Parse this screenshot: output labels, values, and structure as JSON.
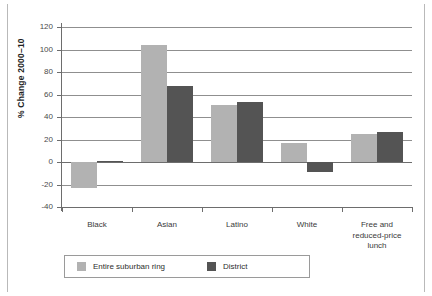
{
  "chart_data": {
    "type": "bar",
    "title": "",
    "xlabel": "",
    "ylabel": "% Change 2000–10",
    "ylim": [
      -40,
      120
    ],
    "ytick_step": 20,
    "yticks": [
      120,
      100,
      80,
      60,
      40,
      20,
      0,
      -20,
      -40
    ],
    "ytick_labels": [
      "120",
      "100",
      "80",
      "60",
      "40",
      "20",
      "0",
      "-20",
      "-40"
    ],
    "grid": true,
    "legend_position": "bottom",
    "categories": [
      "Black",
      "Asian",
      "Latino",
      "White",
      "Free and\nreduced-price\nlunch"
    ],
    "category_labels": [
      [
        "Black"
      ],
      [
        "Asian"
      ],
      [
        "Latino"
      ],
      [
        "White"
      ],
      [
        "Free and",
        "reduced-price",
        "lunch"
      ]
    ],
    "series": [
      {
        "name": "Entire suburban ring",
        "color": "#b2b2b2",
        "values": [
          -23,
          104,
          51,
          17,
          25
        ]
      },
      {
        "name": "District",
        "color": "#545454",
        "values": [
          1,
          68,
          53,
          -9,
          27
        ]
      }
    ]
  },
  "legend": {
    "entries": [
      {
        "label": "Entire suburban ring",
        "color": "#b2b2b2"
      },
      {
        "label": "District",
        "color": "#545454"
      }
    ]
  },
  "colors": {
    "series_light": "#b2b2b2",
    "series_dark": "#545454",
    "gridline": "#8f8f8f",
    "axis": "#6d6d6d",
    "frame_rule": "#b9b9b9",
    "background": "#ffffff"
  }
}
